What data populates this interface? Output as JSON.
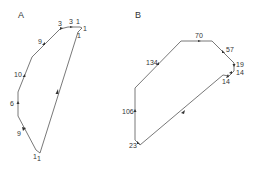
{
  "panels": [
    {
      "label": "A",
      "label_pos": [
        18,
        18
      ],
      "vertices": [
        [
          40,
          153
        ],
        [
          36,
          150
        ],
        [
          18,
          116
        ],
        [
          18,
          92
        ],
        [
          32,
          57
        ],
        [
          60,
          29
        ],
        [
          68,
          27
        ],
        [
          80,
          27
        ],
        [
          82,
          28
        ],
        [
          78,
          32
        ]
      ],
      "edges": [
        {
          "label": "9",
          "pos": [
            26,
            134
          ],
          "arrow": [
            24,
            130
          ]
        },
        {
          "label": "6",
          "pos": [
            10,
            104
          ],
          "arrow": [
            18,
            103
          ]
        },
        {
          "label": "10",
          "pos": [
            15,
            76
          ],
          "arrow": [
            24,
            75
          ]
        },
        {
          "label": "9",
          "pos": [
            38,
            43
          ],
          "arrow": [
            44,
            43
          ]
        },
        {
          "label": "3",
          "pos": [
            58,
            26
          ],
          "arrow": [
            62,
            28
          ]
        },
        {
          "label": "3",
          "pos": [
            68,
            23
          ],
          "arrow": [
            71,
            27
          ]
        },
        {
          "label": "1",
          "pos": [
            78,
            23
          ]
        },
        {
          "label": "1",
          "pos": [
            84,
            30
          ]
        },
        {
          "label": "1",
          "pos": [
            77,
            38
          ]
        },
        {
          "label": "1",
          "pos": [
            34,
            158
          ]
        },
        {
          "label": "1",
          "pos": [
            39,
            160
          ]
        },
        {
          "label": "",
          "pos": [
            0,
            0
          ],
          "arrow": [
            57,
            92
          ]
        }
      ]
    },
    {
      "label": "B",
      "label_pos": [
        135,
        18
      ],
      "vertices": [
        [
          140,
          145
        ],
        [
          135,
          140
        ],
        [
          135,
          88
        ],
        [
          181,
          41
        ],
        [
          212,
          41
        ],
        [
          234,
          63
        ],
        [
          234,
          71
        ],
        [
          229,
          76
        ],
        [
          223,
          75
        ],
        [
          140,
          145
        ]
      ],
      "edges": [
        {
          "label": "134",
          "pos": [
            145,
            64
          ],
          "arrow": [
            158,
            63
          ]
        },
        {
          "label": "70",
          "pos": [
            195,
            38
          ],
          "arrow": [
            199,
            41
          ]
        },
        {
          "label": "57",
          "pos": [
            229,
            55
          ],
          "arrow": [
            224,
            52
          ]
        },
        {
          "label": "19",
          "pos": [
            236,
            67
          ],
          "arrow": [
            234,
            65
          ]
        },
        {
          "label": "14",
          "pos": [
            236,
            74
          ],
          "arrow": [
            232,
            72
          ]
        },
        {
          "label": "14",
          "pos": [
            221,
            85
          ],
          "arrow": [
            227,
            76
          ]
        },
        {
          "label": "106",
          "pos": [
            121,
            115
          ],
          "arrow": [
            135,
            111
          ]
        },
        {
          "label": "23",
          "pos": [
            128,
            148
          ],
          "arrow": [
            139,
            143
          ]
        },
        {
          "label": "",
          "pos": [
            0,
            0
          ],
          "arrow": [
            184,
            112
          ]
        }
      ]
    }
  ]
}
